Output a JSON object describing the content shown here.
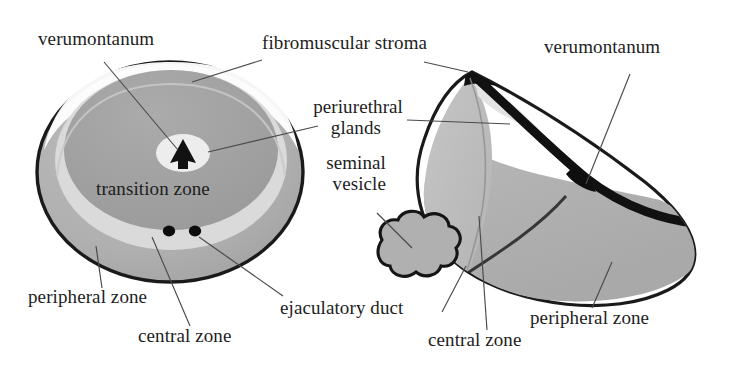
{
  "figure": {
    "background_color": "#ffffff",
    "ink_color": "#1d1d1d",
    "palette": {
      "outline": "#1a1a1a",
      "peripheral_zone_fill": "#b3b3b3",
      "transition_zone_fill": "#a0a0a0",
      "central_zone_fill": "#d9d9d9",
      "urethra_lumen_fill": "#ececec",
      "verumontanum_fill": "#111111",
      "ejaculatory_duct_fill": "#0d0d0d",
      "seminal_vesicle_fill": "#b0b0b0",
      "fibromuscular_stroma_fill": "#ffffff",
      "leader_line_color": "#4a4a4a"
    },
    "views": [
      {
        "name": "axial-view",
        "description": "Cross-sectional (axial) view of the prostate",
        "regions": [
          "peripheral zone",
          "central zone",
          "transition zone",
          "fibromuscular stroma",
          "verumontanum",
          "ejaculatory duct"
        ]
      },
      {
        "name": "sagittal-view",
        "description": "Sagittal / three-quarter view of the prostate with seminal vesicle",
        "regions": [
          "peripheral zone",
          "central zone",
          "periurethral glands",
          "verumontanum",
          "seminal vesicle",
          "fibromuscular stroma"
        ]
      }
    ]
  },
  "labels": {
    "verumontanum_left": "verumontanum",
    "fibromuscular_stroma": "fibromuscular stroma",
    "verumontanum_right": "verumontanum",
    "periurethral_glands_line1": "periurethral",
    "periurethral_glands_line2": "glands",
    "seminal_vesicle_line1": "seminal",
    "seminal_vesicle_line2": "vesicle",
    "transition_zone": "transition zone",
    "peripheral_zone_left": "peripheral zone",
    "central_zone_left": "central zone",
    "ejaculatory_duct": "ejaculatory duct",
    "central_zone_right": "central zone",
    "peripheral_zone_right": "peripheral zone"
  }
}
